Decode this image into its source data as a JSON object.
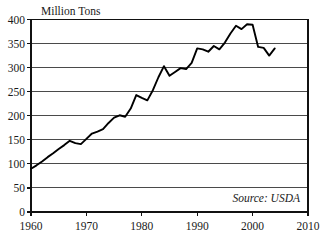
{
  "chart_data": {
    "type": "line",
    "title": "",
    "ylabel": "Million Tons",
    "xlabel": "",
    "source_note": "Source: USDA",
    "xlim": [
      1960,
      2010
    ],
    "ylim": [
      0,
      400
    ],
    "grid": true,
    "legend": null,
    "y_ticks": [
      0,
      50,
      100,
      150,
      200,
      250,
      300,
      350,
      400
    ],
    "y_tick_labels": [
      "0",
      "50",
      "100",
      "150",
      "200",
      "250",
      "300",
      "350",
      "400"
    ],
    "x_ticks": [
      1960,
      1970,
      1980,
      1990,
      2000,
      2010
    ],
    "x_tick_labels": [
      "1960",
      "1970",
      "1980",
      "1990",
      "2000",
      "2010"
    ],
    "series": [
      {
        "name": "Production",
        "color": "#000000",
        "x": [
          1960,
          1961,
          1962,
          1963,
          1964,
          1965,
          1966,
          1967,
          1968,
          1969,
          1970,
          1971,
          1972,
          1973,
          1974,
          1975,
          1976,
          1977,
          1978,
          1979,
          1980,
          1981,
          1982,
          1983,
          1984,
          1985,
          1986,
          1987,
          1988,
          1989,
          1990,
          1991,
          1992,
          1993,
          1994,
          1995,
          1996,
          1997,
          1998,
          1999,
          2000,
          2001,
          2002,
          2003,
          2004
        ],
        "values": [
          90,
          97,
          105,
          114,
          122,
          131,
          139,
          148,
          143,
          141,
          152,
          163,
          167,
          172,
          185,
          196,
          201,
          198,
          215,
          243,
          237,
          232,
          253,
          280,
          303,
          283,
          291,
          299,
          297,
          310,
          340,
          338,
          333,
          345,
          338,
          352,
          371,
          387,
          380,
          390,
          389,
          343,
          341,
          325,
          340
        ]
      }
    ]
  },
  "axis": {
    "y_axis_title": "Million Tons"
  }
}
